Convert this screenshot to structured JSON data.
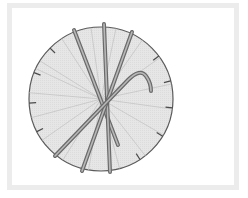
{
  "diagram": {
    "colors": {
      "background": "#ffffff",
      "frame": "#ececec",
      "circle_fill": "#e4e4e4",
      "circle_stroke": "#5a5a5a",
      "spoke": "#c4c4c4",
      "tick": "#4a4a4a",
      "stick_outline": "#6a6a6a",
      "stick_core": "#b8b8b8"
    },
    "circle": {
      "cx": 101,
      "cy": 99,
      "r": 72
    },
    "spoke_angles_deg": [
      -148,
      -123,
      -98,
      -78,
      -55,
      -35,
      -12,
      8,
      30,
      52,
      75,
      100,
      122,
      145,
      165,
      185,
      205
    ],
    "ticks": [
      {
        "x": 51,
        "y": 49
      },
      {
        "x": 35,
        "y": 73
      },
      {
        "x": 30,
        "y": 103
      },
      {
        "x": 38,
        "y": 131
      },
      {
        "x": 163,
        "y": 53
      },
      {
        "x": 170,
        "y": 81
      },
      {
        "x": 173,
        "y": 108
      },
      {
        "x": 164,
        "y": 137
      },
      {
        "x": 139,
        "y": 158
      }
    ],
    "sticks": [
      {
        "name": "stick-upper-left-to-lower",
        "path": "M74 30 L118 145"
      },
      {
        "name": "stick-near-vertical",
        "path": "M104 24 L110 172"
      },
      {
        "name": "stick-upper-right-to-lower-left",
        "path": "M132 32 L82 171"
      },
      {
        "name": "hooked-stick",
        "path": "M55 156 L128 80 Q140 68 146 76 Q151 83 151 91"
      }
    ]
  }
}
